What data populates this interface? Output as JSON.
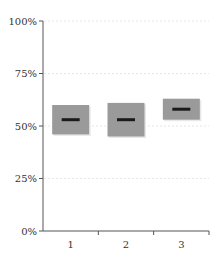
{
  "chart_data": {
    "type": "box",
    "title": "",
    "xlabel": "",
    "ylabel": "",
    "categories": [
      "1",
      "2",
      "3"
    ],
    "boxes": [
      {
        "label": "1",
        "q1": 46,
        "median": 53,
        "q3": 60
      },
      {
        "label": "2",
        "q1": 45,
        "median": 53,
        "q3": 61
      },
      {
        "label": "3",
        "q1": 53,
        "median": 58,
        "q3": 63
      }
    ],
    "ylim": [
      0,
      100
    ],
    "yticks": [
      0,
      25,
      50,
      75,
      100
    ],
    "ytick_labels": [
      "0%",
      "25%",
      "50%",
      "75%",
      "100%"
    ],
    "grid": true,
    "legend": null
  },
  "colors": {
    "box_fill": "#9a9a9a",
    "median": "#1a1a1a",
    "axis": "#555555",
    "grid": "#e6e6e6",
    "shadow": "#e8e8e8"
  }
}
